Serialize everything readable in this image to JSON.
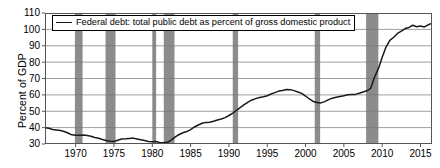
{
  "chart_data": {
    "type": "line",
    "title": "",
    "xlabel": "",
    "ylabel": "Percent of GDP",
    "legend": [
      "Federal debt: total public debt as percent of gross domestic product"
    ],
    "legend_position": "top-left",
    "grid": true,
    "xlim": [
      1966,
      2016.5
    ],
    "ylim": [
      30,
      110
    ],
    "yticks": [
      30,
      40,
      50,
      60,
      70,
      80,
      90,
      100,
      110
    ],
    "xticks": [
      1970,
      1975,
      1980,
      1985,
      1990,
      1995,
      2000,
      2005,
      2010,
      2015
    ],
    "line_color": "#1a1a1a",
    "recession_color": "#8c8c8c",
    "recession_bands": [
      [
        1969.9,
        1970.9
      ],
      [
        1973.9,
        1975.2
      ],
      [
        1980.0,
        1980.5
      ],
      [
        1981.5,
        1982.9
      ],
      [
        1990.5,
        1991.2
      ],
      [
        2001.2,
        2001.9
      ],
      [
        2007.9,
        2009.5
      ]
    ],
    "x": [
      1966.0,
      1966.5,
      1967.0,
      1967.5,
      1968.0,
      1968.5,
      1969.0,
      1969.5,
      1970.0,
      1970.5,
      1971.0,
      1971.5,
      1972.0,
      1972.5,
      1973.0,
      1973.5,
      1974.0,
      1974.5,
      1975.0,
      1975.5,
      1976.0,
      1976.5,
      1977.0,
      1977.5,
      1978.0,
      1978.5,
      1979.0,
      1979.5,
      1980.0,
      1980.5,
      1981.0,
      1981.5,
      1982.0,
      1982.5,
      1983.0,
      1983.5,
      1984.0,
      1984.5,
      1985.0,
      1985.5,
      1986.0,
      1986.5,
      1987.0,
      1987.5,
      1988.0,
      1988.5,
      1989.0,
      1989.5,
      1990.0,
      1990.5,
      1991.0,
      1991.5,
      1992.0,
      1992.5,
      1993.0,
      1993.5,
      1994.0,
      1994.5,
      1995.0,
      1995.5,
      1996.0,
      1996.5,
      1997.0,
      1997.5,
      1998.0,
      1998.5,
      1999.0,
      1999.5,
      2000.0,
      2000.5,
      2001.0,
      2001.5,
      2002.0,
      2002.5,
      2003.0,
      2003.5,
      2004.0,
      2004.5,
      2005.0,
      2005.5,
      2006.0,
      2006.5,
      2007.0,
      2007.5,
      2008.0,
      2008.5,
      2009.0,
      2009.5,
      2010.0,
      2010.5,
      2011.0,
      2011.5,
      2012.0,
      2012.5,
      2013.0,
      2013.5,
      2014.0,
      2014.5,
      2015.0,
      2015.5,
      2016.0,
      2016.4
    ],
    "y": [
      40.0,
      39.6,
      38.9,
      38.6,
      38.3,
      37.6,
      36.7,
      35.6,
      35.4,
      35.3,
      35.5,
      35.2,
      34.7,
      34.0,
      33.5,
      32.8,
      32.2,
      31.7,
      31.5,
      32.3,
      33.1,
      33.2,
      33.4,
      33.6,
      33.1,
      32.6,
      32.1,
      31.5,
      31.3,
      31.5,
      30.8,
      30.7,
      31.0,
      32.5,
      34.4,
      35.8,
      36.9,
      37.6,
      38.8,
      40.4,
      41.6,
      42.7,
      43.2,
      43.3,
      43.9,
      44.6,
      45.3,
      46.1,
      47.4,
      48.8,
      50.6,
      52.3,
      54.0,
      55.6,
      56.9,
      57.7,
      58.4,
      58.8,
      59.5,
      60.5,
      61.4,
      62.3,
      62.7,
      63.3,
      63.2,
      62.6,
      61.8,
      60.9,
      59.3,
      57.5,
      56.0,
      55.4,
      55.1,
      55.9,
      57.1,
      58.0,
      58.5,
      59.0,
      59.5,
      60.1,
      60.2,
      60.3,
      61.0,
      61.8,
      62.5,
      64.0,
      70.8,
      76.0,
      83.0,
      89.2,
      93.3,
      95.2,
      97.5,
      99.0,
      100.5,
      101.2,
      102.5,
      101.6,
      102.1,
      101.5,
      102.8,
      103.5
    ]
  },
  "axis": {
    "ylabel": "Percent of GDP"
  }
}
